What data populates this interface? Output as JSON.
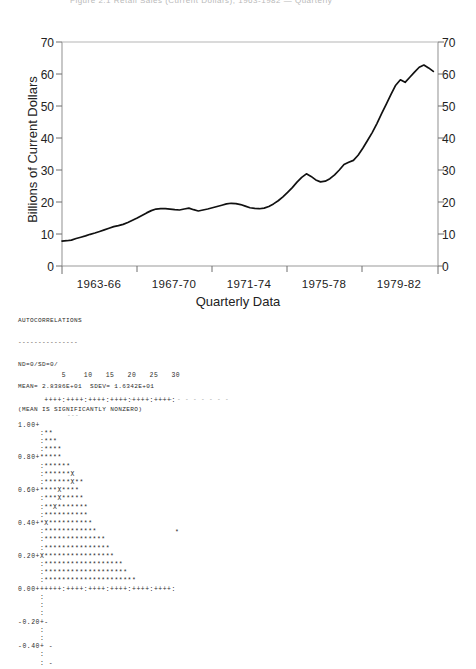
{
  "document": {
    "title_clipped": "Figure 2.1  Retail Sales (Current Dollars), 1963-1982 — Quarterly"
  },
  "line_chart": {
    "ylabel": "Billions of Current Dollars",
    "xlabel": "Quarterly Data",
    "ytick_labels": [
      "0",
      "10",
      "20",
      "30",
      "40",
      "50",
      "60",
      "70"
    ],
    "ytick_labels_right": [
      "0",
      "10",
      "20",
      "30",
      "40",
      "50",
      "60",
      "70"
    ],
    "xtick_labels": [
      "1963-66",
      "1967-70",
      "1971-74",
      "1975-78",
      "1979-82"
    ],
    "axis_color": "#9a9a9a",
    "line_color": "#111111"
  },
  "chart_data": {
    "type": "line",
    "title": "",
    "xlabel": "Quarterly Data",
    "ylabel": "Billions of Current Dollars",
    "ylim": [
      0,
      70
    ],
    "xlim": [
      0,
      80
    ],
    "grid": false,
    "legend": "none",
    "xtick_labels": [
      "1963-66",
      "1967-70",
      "1971-74",
      "1975-78",
      "1979-82"
    ],
    "xtick_positions": [
      7.5,
      23.5,
      39.5,
      55.5,
      71.5
    ],
    "ytick_values": [
      0,
      10,
      20,
      30,
      40,
      50,
      60,
      70
    ],
    "series": [
      {
        "name": "Retail Sales",
        "x": [
          0,
          1,
          2,
          3,
          4,
          5,
          6,
          7,
          8,
          9,
          10,
          11,
          12,
          13,
          14,
          15,
          16,
          17,
          18,
          19,
          20,
          21,
          22,
          23,
          24,
          25,
          26,
          27,
          28,
          29,
          30,
          31,
          32,
          33,
          34,
          35,
          36,
          37,
          38,
          39,
          40,
          41,
          42,
          43,
          44,
          45,
          46,
          47,
          48,
          49,
          50,
          51,
          52,
          53,
          54,
          55,
          56,
          57,
          58,
          59,
          60,
          61,
          62,
          63,
          64,
          65,
          66,
          67,
          68,
          69,
          70,
          71,
          72,
          73,
          74,
          75,
          76,
          77,
          78,
          79
        ],
        "values": [
          7.8,
          7.9,
          8.1,
          8.6,
          9.0,
          9.4,
          9.9,
          10.3,
          10.8,
          11.3,
          11.8,
          12.3,
          12.6,
          13.0,
          13.6,
          14.3,
          15.0,
          15.8,
          16.6,
          17.3,
          17.8,
          17.9,
          17.9,
          17.8,
          17.6,
          17.5,
          17.8,
          18.1,
          17.6,
          17.2,
          17.5,
          17.8,
          18.2,
          18.6,
          19.0,
          19.4,
          19.6,
          19.5,
          19.2,
          18.7,
          18.2,
          18.0,
          17.9,
          18.1,
          18.6,
          19.4,
          20.4,
          21.6,
          23.0,
          24.5,
          26.2,
          27.7,
          28.8,
          28.0,
          26.9,
          26.3,
          26.5,
          27.3,
          28.5,
          30.0,
          31.7,
          32.4,
          33.0,
          34.6,
          36.8,
          39.2,
          41.7,
          44.5,
          47.6,
          50.6,
          53.6,
          56.5,
          58.2,
          57.4,
          59.0,
          60.6,
          62.1,
          62.8,
          61.9,
          60.8
        ]
      }
    ]
  },
  "acf_report": {
    "heading": "AUTOCORRELATIONS",
    "underline": "---------------",
    "line_nd": "ND=0/SD=0/",
    "line_stats": "MEAN= 2.8386E+01  SDEV= 1.6342E+01",
    "line_note": "(MEAN IS SIGNIFICANTLY NONZERO)"
  },
  "acf_plot": {
    "lag_axis_labels": "          5    10   15   20   25   30",
    "lag_axis_rule": "      ++++:++++:++++:++++:++++:++++:",
    "zero_axis_rule": "0.00++++++:++++:++++:++++:++++:++++:",
    "ytick_labels": [
      "1.00+",
      "0.80+",
      "0.60+",
      "0.40+",
      "0.20+",
      "0.00+",
      "-0.20+",
      "-0.40+"
    ],
    "rows": [
      "1.00+",
      "     :**",
      "     :***",
      "     :****",
      "0.80+*****",
      "     :******",
      "     :******X",
      "     :******X**",
      "0.60+****X****",
      "     :***X*****",
      "     :**X*******",
      "     :**********",
      "0.40+*X**********",
      "     :************",
      "     :**************",
      "     :***************",
      "0.20+X****************",
      "     :******************",
      "     :*******************",
      "     :*********************",
      "0.00+",
      "     :",
      "     :",
      "     :",
      "-0.20+-",
      "     :",
      "     :",
      "-0.40+ -",
      "     :",
      "     : -"
    ],
    "confidence_band_top": "- - - - - - - - - - - - - -",
    "confidence_band_second": "---",
    "outlier_star": "*"
  }
}
